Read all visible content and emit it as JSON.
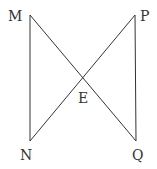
{
  "diagram": {
    "type": "geometry",
    "points": {
      "M": {
        "label": "M",
        "x": 30,
        "y": 15
      },
      "P": {
        "label": "P",
        "x": 135,
        "y": 15
      },
      "N": {
        "label": "N",
        "x": 30,
        "y": 141
      },
      "Q": {
        "label": "Q",
        "x": 136,
        "y": 141
      },
      "E": {
        "label": "E",
        "x": 82,
        "y": 78
      }
    },
    "segments": [
      {
        "from": "M",
        "to": "N"
      },
      {
        "from": "M",
        "to": "Q"
      },
      {
        "from": "N",
        "to": "P"
      },
      {
        "from": "P",
        "to": "Q"
      }
    ],
    "colors": {
      "line": "#333333",
      "text": "#333333",
      "background": "#ffffff"
    }
  }
}
